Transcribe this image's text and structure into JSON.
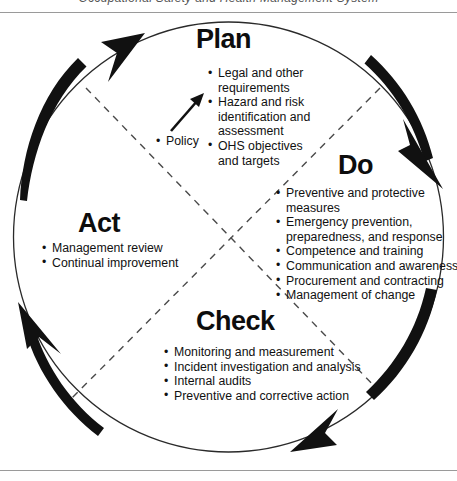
{
  "figure": {
    "clipped_caption": "Occupational Safety and Health Management System",
    "type": "pdca-cycle-diagram",
    "colors": {
      "stroke": "#111111",
      "rule": "#9a9a9a",
      "text": "#111111",
      "background": "#ffffff"
    }
  },
  "center_note": {
    "bullet_label": "Policy"
  },
  "phases": [
    {
      "key": "plan",
      "title": "Plan",
      "items": [
        "Legal and other requirements",
        "Hazard and risk identification and assessment",
        "OHS objectives and targets"
      ]
    },
    {
      "key": "do",
      "title": "Do",
      "items": [
        "Preventive and protective measures",
        "Emergency prevention, preparedness, and response",
        "Competence and training",
        "Communication and awareness",
        "Procurement and contracting",
        "Management of change"
      ]
    },
    {
      "key": "check",
      "title": "Check",
      "items": [
        "Monitoring and measurement",
        "Incident investigation and analysis",
        "Internal audits",
        "Preventive and corrective action"
      ]
    },
    {
      "key": "act",
      "title": "Act",
      "items": [
        "Management review",
        "Continual improvement"
      ]
    }
  ]
}
